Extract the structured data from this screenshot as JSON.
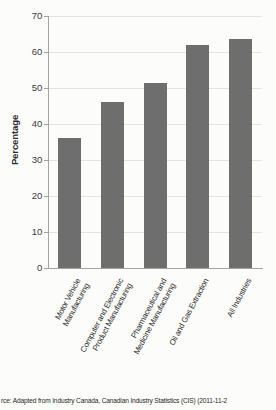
{
  "chart_data": {
    "type": "bar",
    "categories": [
      "Motor Vehicle\nManufacturing",
      "Computer and Electronic\nProduct Manufacturing",
      "Pharmaceutical and\nMedicine Manufacturing",
      "Oil and Gas Extraction",
      "All Industries"
    ],
    "values": [
      36,
      46,
      51.5,
      62,
      63.5
    ],
    "title": "",
    "xlabel": "",
    "ylabel": "Percentage",
    "ylim": [
      0,
      70
    ],
    "yticks": [
      0,
      10,
      20,
      30,
      40,
      50,
      60,
      70
    ],
    "grid": "horizontal",
    "legend": "none",
    "bar_color": "#6e6e6e",
    "gridline_color": "#e3e3e0",
    "axis_color": "#a3a3a0"
  },
  "source_note": "rce: Adapted from Industry Canada, Canadian Industry Statistics (CIS) (2011-11-2"
}
